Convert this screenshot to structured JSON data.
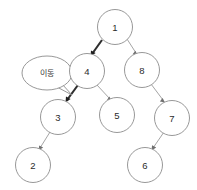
{
  "diagram": {
    "background_color": "#ffffff",
    "node_fill": "#ffffff",
    "node_stroke": "#8c8c8c",
    "edge_color": "#9a9a9a",
    "highlight_edge_color": "#2e2e2e",
    "label_color": "#2b2b2b"
  },
  "nodes": [
    {
      "id": "n1",
      "label": "1",
      "x": 115,
      "y": 27,
      "r": 17.5
    },
    {
      "id": "n4",
      "label": "4",
      "x": 87,
      "y": 71,
      "r": 17.5
    },
    {
      "id": "n8",
      "label": "8",
      "x": 142,
      "y": 70,
      "r": 17.5
    },
    {
      "id": "n3",
      "label": "3",
      "x": 58,
      "y": 117,
      "r": 17.5
    },
    {
      "id": "n5",
      "label": "5",
      "x": 117,
      "y": 115,
      "r": 17.5
    },
    {
      "id": "n7",
      "label": "7",
      "x": 172,
      "y": 118,
      "r": 17.5
    },
    {
      "id": "n2",
      "label": "2",
      "x": 33,
      "y": 165,
      "r": 17.5
    },
    {
      "id": "n6",
      "label": "6",
      "x": 145,
      "y": 165,
      "r": 17.5
    }
  ],
  "edges": [
    {
      "from": "n1",
      "to": "n4",
      "highlighted": true,
      "label": "1-to-4"
    },
    {
      "from": "n1",
      "to": "n8",
      "highlighted": false,
      "label": "1-to-8"
    },
    {
      "from": "n4",
      "to": "n3",
      "highlighted": true,
      "label": "4-to-3"
    },
    {
      "from": "n4",
      "to": "n5",
      "highlighted": false,
      "label": "4-to-5"
    },
    {
      "from": "n3",
      "to": "n2",
      "highlighted": false,
      "label": "3-to-2"
    },
    {
      "from": "n8",
      "to": "n7",
      "highlighted": false,
      "label": "8-to-7"
    },
    {
      "from": "n7",
      "to": "n6",
      "highlighted": false,
      "label": "7-to-6"
    }
  ],
  "callout": {
    "text": "이동",
    "cx": 47,
    "cy": 73,
    "rx": 25,
    "ry": 17,
    "tail_points": "62,84 72,95 57,87"
  }
}
